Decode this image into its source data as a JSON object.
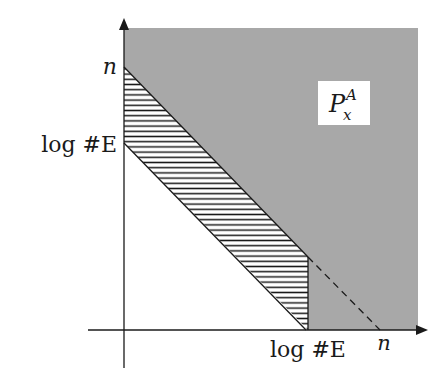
{
  "diagram": {
    "type": "region-plot",
    "colors": {
      "region_fill": "#a8a8a8",
      "hatch_stroke": "#1a1a1a",
      "axis": "#1a1a1a",
      "label_box": "#ffffff"
    },
    "y_axis": {
      "ticks": [
        {
          "label": "n",
          "position": "top"
        },
        {
          "label": "log #E",
          "position": "lower"
        }
      ]
    },
    "x_axis": {
      "ticks": [
        {
          "label": "log #E",
          "position": "left"
        },
        {
          "label": "n",
          "position": "right"
        }
      ]
    },
    "regions": {
      "shaded": {
        "label_main": "P",
        "label_sup": "A",
        "label_sub": "x"
      },
      "hatched": {
        "description": "band between line from n to n and parallel line from log #E to log #E"
      }
    },
    "lines": {
      "dashed": {
        "from": "log #E on x-axis region boundary",
        "to": "n on x-axis"
      }
    }
  }
}
